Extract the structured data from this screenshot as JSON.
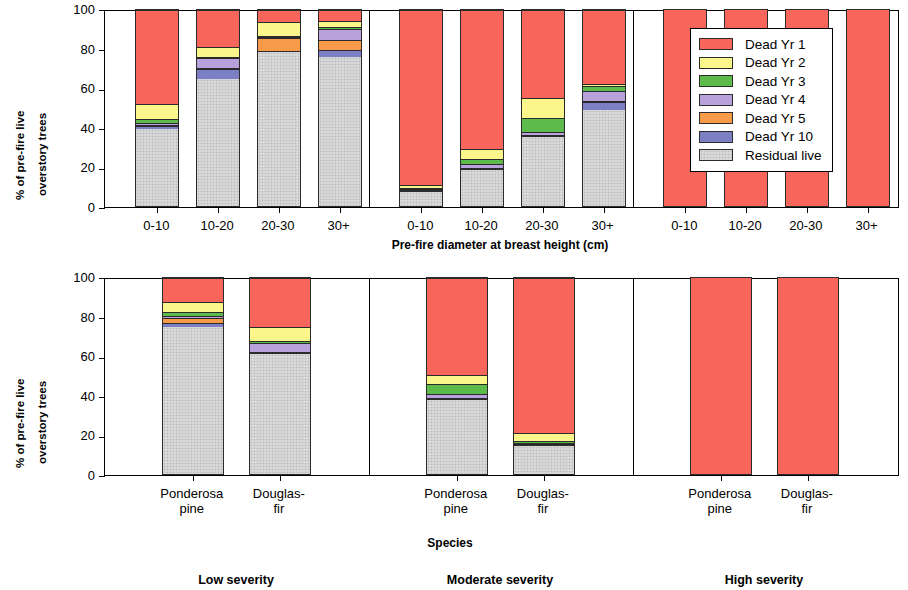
{
  "figure": {
    "width": 908,
    "height": 590
  },
  "legend": {
    "entries": [
      {
        "label": "Dead Yr 1",
        "key": "yr1",
        "color": "#F8655A"
      },
      {
        "label": "Dead Yr 2",
        "key": "yr2",
        "color": "#FAF68C"
      },
      {
        "label": "Dead Yr 3",
        "key": "yr3",
        "color": "#5DBB4B"
      },
      {
        "label": "Dead Yr 4",
        "key": "yr4",
        "color": "#B9A2DC"
      },
      {
        "label": "Dead Yr 5",
        "key": "yr5",
        "color": "#F79B4B"
      },
      {
        "label": "Dead Yr 10",
        "key": "yr10",
        "color": "#7C7FC4"
      },
      {
        "label": "Residual live",
        "key": "residual",
        "color": "#D2D2D2"
      }
    ]
  },
  "axes": {
    "ylabel_line1": "% of pre-fire live",
    "ylabel_line2": "overstory trees",
    "yticks": [
      "0",
      "20",
      "40",
      "60",
      "80",
      "100"
    ],
    "ymin": 0,
    "ymax": 100,
    "top_xlabel": "Pre-fire diameter at breast height (cm)",
    "bottom_xlabel": "Species"
  },
  "severity_labels": [
    {
      "label": "Low severity"
    },
    {
      "label": "Moderate severity"
    },
    {
      "label": "High severity"
    }
  ],
  "chart_data": {
    "type": "bar",
    "subtype": "stacked-bar-100-percent",
    "title": "",
    "xlabel_top": "Pre-fire diameter at breast height (cm)",
    "xlabel_bottom": "Species",
    "ylabel": "% of pre-fire live overstory trees",
    "ylim": [
      0,
      100
    ],
    "yticks": [
      0,
      20,
      40,
      60,
      80,
      100
    ],
    "grid": false,
    "legend_position": "top-right (inside high-severity panel)",
    "series": [
      {
        "name": "Dead Yr 1",
        "key": "yr1",
        "color": "#F8655A"
      },
      {
        "name": "Dead Yr 2",
        "key": "yr2",
        "color": "#FAF68C"
      },
      {
        "name": "Dead Yr 3",
        "key": "yr3",
        "color": "#5DBB4B"
      },
      {
        "name": "Dead Yr 4",
        "key": "yr4",
        "color": "#B9A2DC"
      },
      {
        "name": "Dead Yr 5",
        "key": "yr5",
        "color": "#F79B4B"
      },
      {
        "name": "Dead Yr 10",
        "key": "yr10",
        "color": "#7C7FC4"
      },
      {
        "name": "Residual live",
        "key": "residual",
        "color": "#D2D2D2"
      }
    ],
    "panels": [
      {
        "row": "top",
        "severity": "Low severity",
        "x_axis": "Pre-fire diameter at breast height (cm)",
        "categories": [
          "0-10",
          "10-20",
          "20-30",
          "30+"
        ],
        "bars": [
          {
            "category": "0-10",
            "residual": 39.5,
            "yr10": 1.5,
            "yr5": 0.5,
            "yr4": 1.0,
            "yr3": 2.0,
            "yr2": 7.5,
            "yr1": 48.0
          },
          {
            "category": "10-20",
            "residual": 65.0,
            "yr10": 5.0,
            "yr5": 0.5,
            "yr4": 5.0,
            "yr3": 0.5,
            "yr2": 5.0,
            "yr1": 19.0
          },
          {
            "category": "20-30",
            "residual": 78.5,
            "yr10": 0.5,
            "yr5": 6.5,
            "yr4": 0.5,
            "yr3": 0.5,
            "yr2": 7.5,
            "yr1": 6.0
          },
          {
            "category": "30+",
            "residual": 76.0,
            "yr10": 3.5,
            "yr5": 5.0,
            "yr4": 6.0,
            "yr3": 1.0,
            "yr2": 3.0,
            "yr1": 5.5
          }
        ]
      },
      {
        "row": "top",
        "severity": "Moderate severity",
        "x_axis": "Pre-fire diameter at breast height (cm)",
        "categories": [
          "0-10",
          "10-20",
          "20-30",
          "30+"
        ],
        "bars": [
          {
            "category": "0-10",
            "residual": 7.0,
            "yr10": 0.5,
            "yr5": 0.5,
            "yr4": 0.5,
            "yr3": 0.5,
            "yr2": 1.5,
            "yr1": 89.5
          },
          {
            "category": "10-20",
            "residual": 18.5,
            "yr10": 0.5,
            "yr5": 0.5,
            "yr4": 2.0,
            "yr3": 2.5,
            "yr2": 5.0,
            "yr1": 71.0
          },
          {
            "category": "20-30",
            "residual": 35.0,
            "yr10": 0.5,
            "yr5": 0.5,
            "yr4": 2.0,
            "yr3": 7.0,
            "yr2": 10.0,
            "yr1": 45.0
          },
          {
            "category": "30+",
            "residual": 49.0,
            "yr10": 4.0,
            "yr5": 0.5,
            "yr4": 5.0,
            "yr3": 2.5,
            "yr2": 1.5,
            "yr1": 37.5
          }
        ]
      },
      {
        "row": "top",
        "severity": "High severity",
        "x_axis": "Pre-fire diameter at breast height (cm)",
        "categories": [
          "0-10",
          "10-20",
          "20-30",
          "30+"
        ],
        "bars": [
          {
            "category": "0-10",
            "residual": 0,
            "yr10": 0,
            "yr5": 0,
            "yr4": 0,
            "yr3": 0,
            "yr2": 0,
            "yr1": 100
          },
          {
            "category": "10-20",
            "residual": 0,
            "yr10": 0,
            "yr5": 0,
            "yr4": 0,
            "yr3": 0,
            "yr2": 0,
            "yr1": 100
          },
          {
            "category": "20-30",
            "residual": 0,
            "yr10": 0,
            "yr5": 0,
            "yr4": 0,
            "yr3": 0,
            "yr2": 0,
            "yr1": 100
          },
          {
            "category": "30+",
            "residual": 0,
            "yr10": 0,
            "yr5": 0,
            "yr4": 0,
            "yr3": 0,
            "yr2": 0,
            "yr1": 100
          }
        ]
      },
      {
        "row": "bottom",
        "severity": "Low severity",
        "x_axis": "Species",
        "categories": [
          "Ponderosa pine",
          "Douglas-fir"
        ],
        "bars": [
          {
            "category": "Ponderosa pine",
            "residual": 75.0,
            "yr10": 2.0,
            "yr5": 2.5,
            "yr4": 1.0,
            "yr3": 2.0,
            "yr2": 5.5,
            "yr1": 12.0
          },
          {
            "category": "Douglas-fir",
            "residual": 61.0,
            "yr10": 0.5,
            "yr5": 1.0,
            "yr4": 4.5,
            "yr3": 1.0,
            "yr2": 7.0,
            "yr1": 25.0
          }
        ]
      },
      {
        "row": "bottom",
        "severity": "Moderate severity",
        "x_axis": "Species",
        "categories": [
          "Ponderosa pine",
          "Douglas-fir"
        ],
        "bars": [
          {
            "category": "Ponderosa pine",
            "residual": 38.0,
            "yr10": 0.5,
            "yr5": 0.5,
            "yr4": 2.0,
            "yr3": 5.0,
            "yr2": 4.5,
            "yr1": 49.5
          },
          {
            "category": "Douglas-fir",
            "residual": 14.5,
            "yr10": 0.5,
            "yr5": 0.5,
            "yr4": 0.5,
            "yr3": 1.0,
            "yr2": 4.0,
            "yr1": 79.0
          }
        ]
      },
      {
        "row": "bottom",
        "severity": "High severity",
        "x_axis": "Species",
        "categories": [
          "Ponderosa pine",
          "Douglas-fir"
        ],
        "bars": [
          {
            "category": "Ponderosa pine",
            "residual": 0,
            "yr10": 0,
            "yr5": 0,
            "yr4": 0,
            "yr3": 0,
            "yr2": 0,
            "yr1": 100
          },
          {
            "category": "Douglas-fir",
            "residual": 0,
            "yr10": 0,
            "yr5": 0,
            "yr4": 0,
            "yr3": 0,
            "yr2": 0,
            "yr1": 100
          }
        ]
      }
    ]
  }
}
